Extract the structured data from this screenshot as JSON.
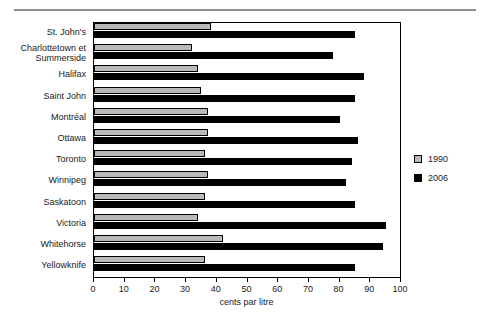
{
  "title_partial": "",
  "chart_data": {
    "type": "bar",
    "orientation": "horizontal",
    "title": "",
    "xlabel": "cents par litre",
    "ylabel": "",
    "xlim": [
      0,
      100
    ],
    "xticks": [
      0,
      10,
      20,
      30,
      40,
      50,
      60,
      70,
      80,
      90,
      100
    ],
    "grid": false,
    "legend_position": "right",
    "categories": [
      "St. John's",
      "Charlottetown et Summerside",
      "Halifax",
      "Saint John",
      "Montréal",
      "Ottawa",
      "Toronto",
      "Winnipeg",
      "Saskatoon",
      "Victoria",
      "Whitehorse",
      "Yellowknife"
    ],
    "series": [
      {
        "name": "1990",
        "color": "#b9b9b9",
        "values": [
          38,
          32,
          34,
          35,
          37,
          37,
          36,
          37,
          36,
          34,
          42,
          36
        ]
      },
      {
        "name": "2006",
        "color": "#000000",
        "values": [
          85,
          78,
          88,
          85,
          80,
          86,
          84,
          82,
          85,
          95,
          94,
          85
        ]
      }
    ]
  },
  "legend": {
    "items": [
      {
        "label": "1990",
        "color": "#b9b9b9"
      },
      {
        "label": "2006",
        "color": "#000000"
      }
    ]
  },
  "axis": {
    "x_label": "cents par litre",
    "tick_labels": [
      "0",
      "10",
      "20",
      "30",
      "40",
      "50",
      "60",
      "70",
      "80",
      "90",
      "100"
    ]
  }
}
